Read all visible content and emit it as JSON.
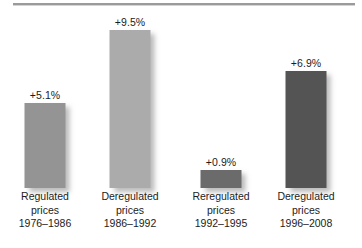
{
  "chart_data": {
    "type": "bar",
    "title": "",
    "subtitle": "",
    "xlabel": "",
    "ylabel": "",
    "ylim": [
      0,
      10.4
    ],
    "grid": false,
    "legend": false,
    "categories": [
      "Regulated prices 1976–1986",
      "Deregulated prices 1986–1992",
      "Reregulated prices 1992–1995",
      "Deregulated prices 1996–2008"
    ],
    "values": [
      5.1,
      9.5,
      0.9,
      6.9
    ],
    "data_labels": [
      "+5.1%",
      "+9.5%",
      "+0.9%",
      "+6.9%"
    ],
    "bar_colors": [
      "#949494",
      "#ababab",
      "#6b6b6b",
      "#545454"
    ],
    "annotations": []
  },
  "figure": {
    "background": "#ffffff",
    "rule_color": "#9a9a9a",
    "shadow_color": "#787878",
    "text_color": "#1c1c1c"
  },
  "bars": [
    {
      "value_label": "+5.1%",
      "color": "#949494",
      "height_px": 85,
      "left_px": 2,
      "category_lines": [
        "Regulated",
        "prices",
        "1976–1986"
      ]
    },
    {
      "value_label": "+9.5%",
      "color": "#ababab",
      "height_px": 158,
      "left_px": 87,
      "category_lines": [
        "Deregulated",
        "prices",
        "1986–1992"
      ]
    },
    {
      "value_label": "+0.9%",
      "color": "#6b6b6b",
      "height_px": 18,
      "left_px": 178,
      "category_lines": [
        "Reregulated",
        "prices",
        "1992–1995"
      ]
    },
    {
      "value_label": "+6.9%",
      "color": "#545454",
      "height_px": 117,
      "left_px": 263,
      "category_lines": [
        "Deregulated",
        "prices",
        "1996–2008"
      ]
    }
  ]
}
